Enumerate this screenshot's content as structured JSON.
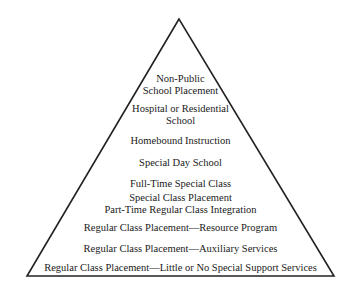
{
  "diagram": {
    "type": "pyramid",
    "colors": {
      "line": "#222222",
      "text": "#1a1a1a",
      "background": "#ffffff"
    },
    "levels": [
      {
        "line1": "Non-Public",
        "line2": "School Placement"
      },
      {
        "line1": "Hospital or Residential",
        "line2": "School"
      },
      {
        "line1": "Homebound Instruction"
      },
      {
        "line1": "Special Day School"
      },
      {
        "line1": "Full-Time Special Class"
      },
      {
        "line1": "Special Class Placement",
        "line2": "Part-Time Regular Class Integration"
      },
      {
        "line1": "Regular Class Placement—Resource Program"
      },
      {
        "line1": "Regular Class Placement—Auxiliary Services"
      },
      {
        "line1": "Regular Class Placement—Little or No Special Support Services"
      }
    ]
  }
}
